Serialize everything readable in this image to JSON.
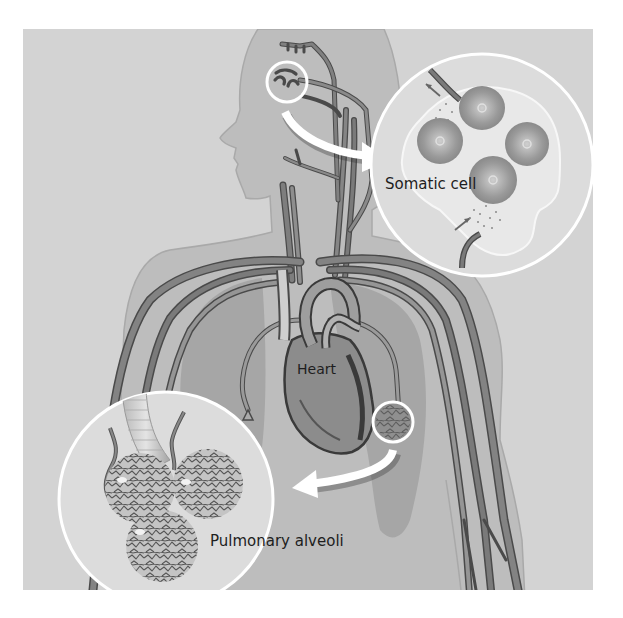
{
  "figure": {
    "labels": {
      "somatic_cell": "Somatic cell",
      "heart": "Heart",
      "pulmonary_alveoli": "Pulmonary alveoli"
    },
    "colors": {
      "page_background": "#ffffff",
      "panel_background": "#d3d3d3",
      "body_silhouette": "#bdbdbd",
      "lung": "#a8a8a8",
      "vessel": "#7e7e7e",
      "vessel_outline": "#4a4a4a",
      "heart": "#8a8a8a",
      "magnifier_fill": "#dedede",
      "magnifier_ring": "#ffffff",
      "arrow": "#ffffff"
    }
  }
}
